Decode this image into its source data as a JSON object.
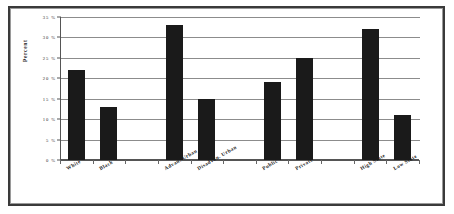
{
  "chart_data": {
    "type": "bar",
    "title": "",
    "subtitle": "",
    "xlabel": "",
    "ylabel": "Percent",
    "ylim": [
      0,
      35
    ],
    "ytick_labels": [
      "35 %",
      "30 %",
      "25 %",
      "20 %",
      "15 %",
      "10 %",
      "5 %",
      "0 %"
    ],
    "ytick_values": [
      35,
      30,
      25,
      20,
      15,
      10,
      5,
      0
    ],
    "grid": true,
    "legend": null,
    "legend_position": "none",
    "orientation": "vertical",
    "bar_color": "#1a1a1a",
    "categories": [
      "White",
      "Black",
      "Advan. Urban",
      "Disadvan. Urban",
      "Public",
      "Private",
      "High State",
      "Low State"
    ],
    "values": [
      22,
      13,
      33,
      15,
      19,
      25,
      32,
      11
    ],
    "groups": [
      {
        "name": "Race",
        "categories": [
          "White",
          "Black"
        ]
      },
      {
        "name": "Urbanicity",
        "categories": [
          "Advan. Urban",
          "Disadvan. Urban"
        ]
      },
      {
        "name": "School Type",
        "categories": [
          "Public",
          "Private"
        ]
      },
      {
        "name": "State Poverty",
        "categories": [
          "High State",
          "Low State"
        ]
      }
    ],
    "slots": [
      {
        "label": "White",
        "value": 22,
        "slot": 0
      },
      {
        "label": "Black",
        "value": 13,
        "slot": 1
      },
      {
        "label": "Advan. Urban",
        "value": 33,
        "slot": 3
      },
      {
        "label": "Disadvan. Urban",
        "value": 15,
        "slot": 4
      },
      {
        "label": "Public",
        "value": 19,
        "slot": 6
      },
      {
        "label": "Private",
        "value": 25,
        "slot": 7
      },
      {
        "label": "High State",
        "value": 32,
        "slot": 9
      },
      {
        "label": "Low State",
        "value": 11,
        "slot": 10
      }
    ]
  },
  "figure": {
    "frame_color": "#3a3a3a",
    "background": "#ffffff"
  }
}
